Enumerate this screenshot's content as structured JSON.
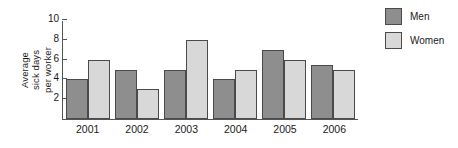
{
  "chart_data": {
    "type": "bar",
    "title": "",
    "subtitle": "",
    "xlabel": "",
    "ylabel": "Average sick days per worker",
    "ylabel_lines": [
      "Average",
      "sick days",
      "per worker"
    ],
    "categories": [
      "2001",
      "2002",
      "2003",
      "2004",
      "2005",
      "2006"
    ],
    "series": [
      {
        "name": "Men",
        "color": "#8e8e8e",
        "values": [
          4,
          5,
          5,
          4,
          7,
          5.5
        ]
      },
      {
        "name": "Women",
        "color": "#d8d8d8",
        "values": [
          6,
          3,
          8,
          5,
          6,
          5
        ]
      }
    ],
    "ylim": [
      0,
      10
    ],
    "yticks": [
      2,
      4,
      6,
      8,
      10
    ],
    "ytick_labels": [
      "2",
      "4",
      "6",
      "8",
      "10"
    ],
    "grid": false,
    "legend_position": "top-right",
    "legend_entries": [
      "Men",
      "Women"
    ]
  }
}
